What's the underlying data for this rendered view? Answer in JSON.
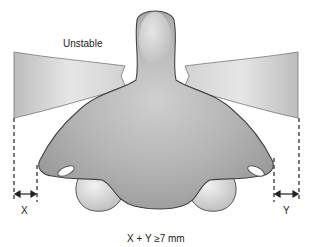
{
  "figure": {
    "label_unstable": "Unstable",
    "label_x": "X",
    "label_y": "Y",
    "caption": "X + Y ≥7 mm"
  }
}
